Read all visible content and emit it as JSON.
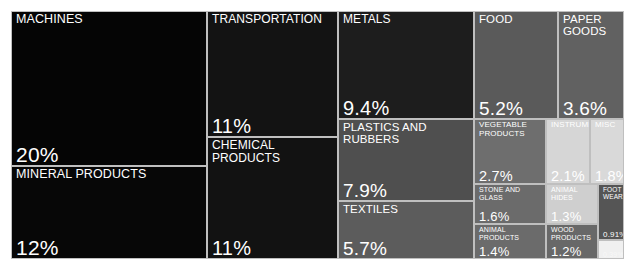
{
  "chart_data": {
    "type": "treemap",
    "title": "",
    "xlabel": "",
    "ylabel": "",
    "value_unit": "percent",
    "legend": "none",
    "grid": false,
    "categories": [
      "MACHINES",
      "MINERAL PRODUCTS",
      "TRANSPORTATION",
      "CHEMICAL PRODUCTS",
      "METALS",
      "PLASTICS AND RUBBERS",
      "TEXTILES",
      "FOOD",
      "PAPER GOODS",
      "VEGETABLE PRODUCTS",
      "INSTRUMENTS",
      "MISC",
      "STONE AND GLASS",
      "ANIMAL HIDES",
      "FOOT WEAR",
      "ANIMAL PRODUCTS",
      "WOOD PRODUCTS",
      "ARTS"
    ],
    "values": [
      20,
      12,
      11,
      11,
      9.4,
      7.9,
      5.7,
      5.2,
      3.6,
      2.7,
      2.1,
      1.8,
      1.6,
      1.3,
      0.91,
      1.4,
      1.2,
      0.39
    ],
    "value_labels": [
      "20%",
      "12%",
      "11%",
      "11%",
      "9.4%",
      "7.9%",
      "5.7%",
      "5.2%",
      "3.6%",
      "2.7%",
      "2.1%",
      "1.8%",
      "1.6%",
      "1.3%",
      "0.91%",
      "1.4%",
      "1.2%",
      "0.39%"
    ]
  },
  "tiles": [
    {
      "name": "machines",
      "label": "MACHINES",
      "value_label": "20%",
      "color": "#050505",
      "text_color": "#ffffff",
      "x": 0,
      "y": 0,
      "w": 196,
      "h": 155,
      "size": "sz-xl"
    },
    {
      "name": "mineral-products",
      "label": "MINERAL PRODUCTS",
      "value_label": "12%",
      "color": "#070707",
      "text_color": "#ffffff",
      "x": 0,
      "y": 155,
      "w": 196,
      "h": 93,
      "size": "sz-xl"
    },
    {
      "name": "transportation",
      "label": "TRANSPORTATION",
      "value_label": "11%",
      "color": "#131313",
      "text_color": "#ffffff",
      "x": 196,
      "y": 0,
      "w": 131,
      "h": 126,
      "size": "sz-lg"
    },
    {
      "name": "chemical-products",
      "label": "CHEMICAL PRODUCTS",
      "value_label": "11%",
      "color": "#121212",
      "text_color": "#ffffff",
      "x": 196,
      "y": 126,
      "w": 131,
      "h": 122,
      "size": "sz-lg"
    },
    {
      "name": "metals",
      "label": "METALS",
      "value_label": "9.4%",
      "color": "#1d1d1d",
      "text_color": "#ffffff",
      "x": 327,
      "y": 0,
      "w": 136,
      "h": 108,
      "size": "sz-lg"
    },
    {
      "name": "plastics-and-rubbers",
      "label": "PLASTICS AND RUBBERS",
      "value_label": "7.9%",
      "color": "#4f4f4f",
      "text_color": "#ffffff",
      "x": 327,
      "y": 108,
      "w": 136,
      "h": 82,
      "size": "sz-md"
    },
    {
      "name": "textiles",
      "label": "TEXTILES",
      "value_label": "5.7%",
      "color": "#5c5c5c",
      "text_color": "#ffffff",
      "x": 327,
      "y": 190,
      "w": 136,
      "h": 58,
      "size": "sz-md"
    },
    {
      "name": "food",
      "label": "FOOD",
      "value_label": "5.2%",
      "color": "#5a5a5a",
      "text_color": "#ffffff",
      "x": 463,
      "y": 0,
      "w": 84,
      "h": 108,
      "size": "sz-md"
    },
    {
      "name": "paper-goods",
      "label": "PAPER GOODS",
      "value_label": "3.6%",
      "color": "#616161",
      "text_color": "#ffffff",
      "x": 547,
      "y": 0,
      "w": 66,
      "h": 108,
      "size": "sz-md"
    },
    {
      "name": "vegetable-products",
      "label": "VEGETABLE PRODUCTS",
      "value_label": "2.7%",
      "color": "#6e6e6e",
      "text_color": "#ffffff",
      "x": 463,
      "y": 108,
      "w": 72,
      "h": 65,
      "size": "sz-sm"
    },
    {
      "name": "instruments",
      "label": "INSTRUMENTS",
      "value_label": "2.1%",
      "color": "#d6d6d6",
      "text_color": "#ffffff",
      "x": 535,
      "y": 108,
      "w": 44,
      "h": 65,
      "size": "sz-sm"
    },
    {
      "name": "misc",
      "label": "MISC",
      "value_label": "1.8%",
      "color": "#d9d9d9",
      "text_color": "#ffffff",
      "x": 579,
      "y": 108,
      "w": 34,
      "h": 65,
      "size": "sz-sm"
    },
    {
      "name": "stone-and-glass",
      "label": "STONE AND GLASS",
      "value_label": "1.6%",
      "color": "#6b6b6b",
      "text_color": "#ffffff",
      "x": 463,
      "y": 173,
      "w": 72,
      "h": 40,
      "size": "sz-xs"
    },
    {
      "name": "animal-hides",
      "label": "ANIMAL HIDES",
      "value_label": "1.3%",
      "color": "#cfcfcf",
      "text_color": "#ffffff",
      "x": 535,
      "y": 173,
      "w": 52,
      "h": 40,
      "size": "sz-xs"
    },
    {
      "name": "foot-wear",
      "label": "FOOT WEAR",
      "value_label": "0.91%",
      "color": "#555555",
      "text_color": "#ffffff",
      "x": 587,
      "y": 173,
      "w": 26,
      "h": 56,
      "size": "sz-tiny"
    },
    {
      "name": "animal-products",
      "label": "ANIMAL PRODUCTS",
      "value_label": "1.4%",
      "color": "#6b6b6b",
      "text_color": "#ffffff",
      "x": 463,
      "y": 213,
      "w": 72,
      "h": 35,
      "size": "sz-xs"
    },
    {
      "name": "wood-products",
      "label": "WOOD PRODUCTS",
      "value_label": "1.2%",
      "color": "#686868",
      "text_color": "#ffffff",
      "x": 535,
      "y": 213,
      "w": 52,
      "h": 35,
      "size": "sz-xs"
    },
    {
      "name": "arts",
      "label": "",
      "value_label": "0.39%",
      "color": "#f0f0f0",
      "text_color": "#f8f8f8",
      "x": 587,
      "y": 229,
      "w": 26,
      "h": 19,
      "size": "sz-micro"
    }
  ]
}
